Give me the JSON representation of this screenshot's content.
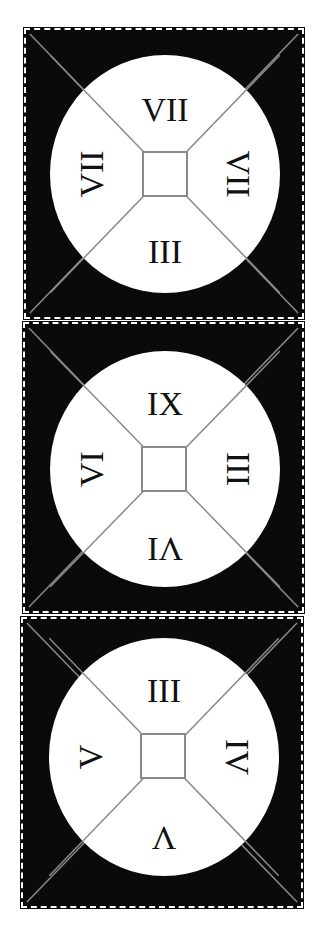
{
  "panels": [
    {
      "top": "VII",
      "left": "VII",
      "right": "VII",
      "bottom": "III"
    },
    {
      "top": "IX",
      "left": "VI",
      "right": "III",
      "bottom": "VI"
    },
    {
      "top": "III",
      "left": "V",
      "right": "IV",
      "bottom": "V"
    }
  ],
  "colors": {
    "background": "#0a0a0a",
    "circle": "#ffffff",
    "lines": "#8a8a8a",
    "text": "#111111"
  }
}
